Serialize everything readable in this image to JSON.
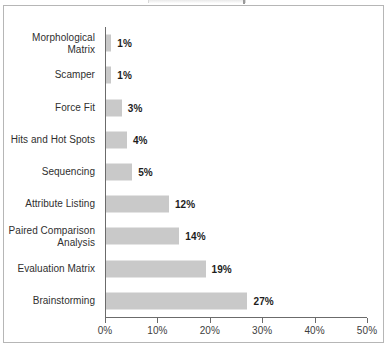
{
  "chart_data": {
    "type": "bar",
    "orientation": "horizontal",
    "title": "",
    "xlabel": "",
    "ylabel": "",
    "categories": [
      "Morphological Matrix",
      "Scamper",
      "Force Fit",
      "Hits and Hot Spots",
      "Sequencing",
      "Attribute Listing",
      "Paired Comparison Analysis",
      "Evaluation Matrix",
      "Brainstorming"
    ],
    "values": [
      1,
      1,
      3,
      4,
      5,
      12,
      14,
      19,
      27
    ],
    "value_labels": [
      "1%",
      "1%",
      "3%",
      "4%",
      "5%",
      "12%",
      "14%",
      "19%",
      "27%"
    ],
    "xlim": [
      0,
      50
    ],
    "xticks": [
      0,
      10,
      20,
      30,
      40,
      50
    ],
    "xtick_labels": [
      "0%",
      "10%",
      "20%",
      "30%",
      "40%",
      "50%"
    ],
    "grid": false,
    "legend": null,
    "bar_color": "#c9c9c9",
    "axis_color": "#6b6b6b",
    "text_color": "#2f2f2f",
    "frame_color": "#b6b6b6",
    "background": "#ffffff"
  },
  "category_label_lines": [
    [
      "Morphological Matrix"
    ],
    [
      "Scamper"
    ],
    [
      "Force Fit"
    ],
    [
      "Hits and Hot Spots"
    ],
    [
      "Sequencing"
    ],
    [
      "Attribute Listing"
    ],
    [
      "Paired Comparison",
      "Analysis"
    ],
    [
      "Evaluation Matrix"
    ],
    [
      "Brainstorming"
    ]
  ]
}
